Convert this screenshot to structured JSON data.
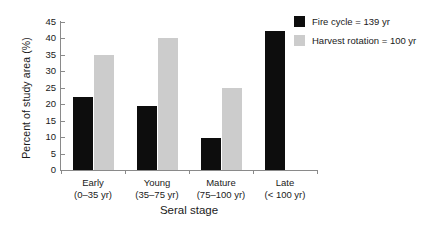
{
  "chart_data": {
    "type": "bar",
    "title": "",
    "xlabel": "Seral stage",
    "ylabel": "Percent of study area (%)",
    "ylim": [
      0,
      45
    ],
    "yticks": [
      0,
      5,
      10,
      15,
      20,
      25,
      30,
      35,
      40,
      45
    ],
    "ytick_labels": [
      "0",
      "5",
      "10",
      "15",
      "20",
      "25",
      "30",
      "35",
      "40",
      "45"
    ],
    "grid": false,
    "legend_position": "top-right",
    "categories": [
      "Early",
      "Young",
      "Mature",
      "Late"
    ],
    "category_ranges": [
      "(0–35 yr)",
      "(35–75 yr)",
      "(75–100 yr)",
      "(< 100 yr)"
    ],
    "category_labels": [
      "Early (0–35 yr)",
      "Young (35–75 yr)",
      "Mature (75–100 yr)",
      "Late (< 100 yr)"
    ],
    "series": [
      {
        "name": "Fire cycle = 139 yr",
        "color": "#0d0d0d",
        "values": [
          22.2,
          19.4,
          9.8,
          42.4
        ]
      },
      {
        "name": "Harvest rotation = 100 yr",
        "color": "#cccccc",
        "values": [
          35.0,
          40.1,
          25.0,
          null
        ]
      }
    ]
  },
  "legend": {
    "items": [
      {
        "label": "Fire cycle = 139 yr",
        "color": "#0d0d0d"
      },
      {
        "label": "Harvest rotation = 100 yr",
        "color": "#cccccc"
      }
    ]
  },
  "axes": {
    "y_title": "Percent of study area (%)",
    "x_title": "Seral stage"
  }
}
